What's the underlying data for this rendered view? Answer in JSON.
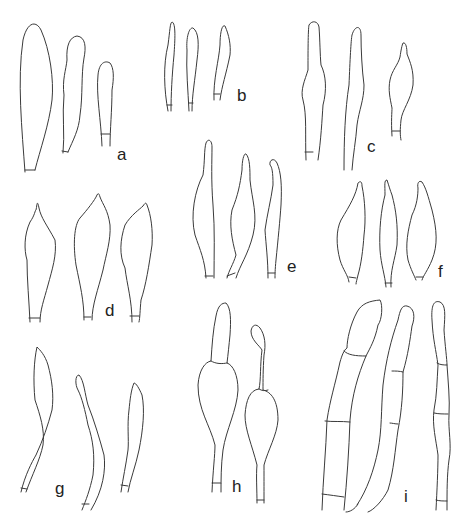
{
  "figure": {
    "type": "botanical/mycological line drawing",
    "panels": [
      {
        "id": "a",
        "label": "a",
        "elements": 3
      },
      {
        "id": "b",
        "label": "b",
        "elements": 3
      },
      {
        "id": "c",
        "label": "c",
        "elements": 3
      },
      {
        "id": "d",
        "label": "d",
        "elements": 3
      },
      {
        "id": "e",
        "label": "e",
        "elements": 3
      },
      {
        "id": "f",
        "label": "f",
        "elements": 3
      },
      {
        "id": "g",
        "label": "g",
        "elements": 3
      },
      {
        "id": "h",
        "label": "h",
        "elements": 2
      },
      {
        "id": "i",
        "label": "i",
        "elements": 3
      }
    ],
    "line_color": "#3a3a3a",
    "background": "#ffffff"
  }
}
